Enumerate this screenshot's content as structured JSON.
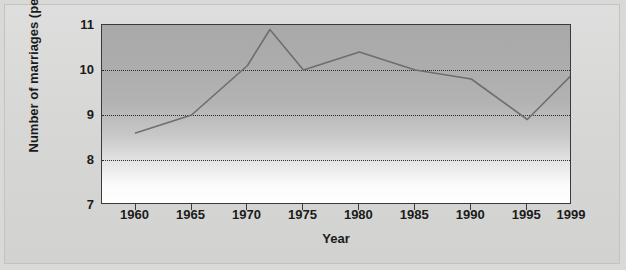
{
  "chart_data": {
    "type": "line",
    "title": "",
    "xlabel": "Year",
    "ylabel": "Number of marriages (per 1,000)",
    "xlim": [
      1957,
      1999
    ],
    "ylim": [
      7,
      11
    ],
    "grid": true,
    "gridlines_y": [
      8,
      9,
      10
    ],
    "legend": null,
    "x_tick_labels": [
      "1960",
      "1965",
      "1970",
      "1975",
      "1980",
      "1985",
      "1990",
      "1995",
      "1999"
    ],
    "x_ticks": [
      1960,
      1965,
      1970,
      1975,
      1980,
      1985,
      1990,
      1995,
      1999
    ],
    "y_tick_labels": [
      "7",
      "8",
      "9",
      "10",
      "11"
    ],
    "y_ticks": [
      7,
      8,
      9,
      10,
      11
    ],
    "series": [
      {
        "name": "Number of marriages (per 1,000)",
        "color": "#6e6e6e",
        "x": [
          1960,
          1965,
          1970,
          1972,
          1975,
          1980,
          1985,
          1990,
          1995,
          1999
        ],
        "values": [
          8.6,
          9.0,
          10.1,
          10.9,
          10.0,
          10.4,
          10.0,
          9.8,
          8.9,
          9.9
        ]
      }
    ]
  },
  "axes": {
    "y_title": "Number of marriages (per 1,000)",
    "x_title": "Year"
  },
  "colors": {
    "page_background": "#d9d9d7",
    "plot_border": "#3a3a3a",
    "series_line": "#6e6e6e",
    "gridline": "#2b2b2b",
    "tick_text": "#1b1b1b"
  }
}
